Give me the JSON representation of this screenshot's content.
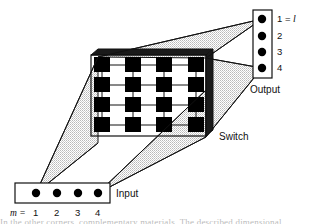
{
  "figure": {
    "colors": {
      "ink": "#111111",
      "node_fill": "#000000",
      "cone_fill": "#d9d9d9",
      "cone_stroke": "#111111",
      "switch_face": "#ffffff",
      "switch_depth": "#1a1a1a",
      "background": "#ffffff"
    },
    "input": {
      "label": "Input",
      "prefix": "m =",
      "ports": [
        {
          "label": "1"
        },
        {
          "label": "2"
        },
        {
          "label": "3"
        },
        {
          "label": "4"
        }
      ]
    },
    "output": {
      "label": "Output",
      "ports": [
        {
          "label": "1 =",
          "italic": "l"
        },
        {
          "label": "2",
          "italic": ""
        },
        {
          "label": "3",
          "italic": ""
        },
        {
          "label": "4",
          "italic": ""
        }
      ]
    },
    "switch": {
      "label": "Switch",
      "rows": 4,
      "cols": 4,
      "cells": [
        [
          1,
          1,
          1,
          1
        ],
        [
          1,
          1,
          1,
          1
        ],
        [
          1,
          1,
          1,
          1
        ],
        [
          1,
          1,
          1,
          1
        ]
      ]
    },
    "caption_fragment": "In the other corners, complementary materials. The described dimensional"
  }
}
